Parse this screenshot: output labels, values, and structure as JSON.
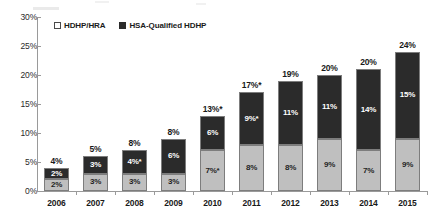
{
  "chart_data": {
    "type": "bar",
    "subtype": "stacked-bar",
    "title": "",
    "subtitle": "",
    "xlabel": "",
    "ylabel": "",
    "ylim": [
      0,
      30
    ],
    "y_tick_labels": [
      "0%",
      "5%",
      "10%",
      "15%",
      "20%",
      "25%",
      "30%"
    ],
    "y_tick_values": [
      0,
      5,
      10,
      15,
      20,
      25,
      30
    ],
    "grid": false,
    "legend_position": "top-left-inside",
    "categories": [
      "2006",
      "2007",
      "2008",
      "2009",
      "2010",
      "2011",
      "2012",
      "2013",
      "2014",
      "2015"
    ],
    "series": [
      {
        "name": "HDHP/HRA",
        "color": "#bfbfbf",
        "swatch": "open",
        "values": [
          2,
          3,
          3,
          3,
          7,
          8,
          8,
          9,
          7,
          9
        ],
        "labels": [
          "2%",
          "3%",
          "3%",
          "3%",
          "7%*",
          "8%",
          "8%",
          "9%",
          "7%",
          "9%"
        ]
      },
      {
        "name": "HSA-Qualified HDHP",
        "color": "#2b2b2b",
        "swatch": "filled",
        "values": [
          2,
          3,
          4,
          6,
          6,
          9,
          11,
          11,
          14,
          15
        ],
        "labels": [
          "2%",
          "3%",
          "4%*",
          "6%",
          "6%",
          "9%*",
          "11%",
          "11%",
          "14%",
          "15%"
        ]
      }
    ],
    "totals": [
      4,
      5,
      8,
      8,
      13,
      17,
      19,
      20,
      20,
      24
    ],
    "total_labels": [
      "4%",
      "5%",
      "8%",
      "8%",
      "13%*",
      "17%*",
      "19%",
      "20%",
      "20%",
      "24%"
    ]
  },
  "legend": {
    "items": [
      {
        "label": "HDHP/HRA"
      },
      {
        "label": "HSA-Qualified HDHP"
      }
    ]
  }
}
